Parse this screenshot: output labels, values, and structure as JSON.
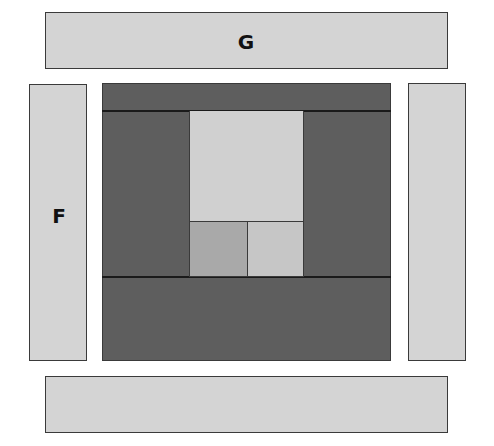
{
  "diagram": {
    "panels": {
      "top": {
        "label": "G"
      },
      "left": {
        "label": "F"
      },
      "right": {
        "label": ""
      },
      "bottom": {
        "label": ""
      }
    },
    "center": {
      "regions": [
        {
          "name": "top-strip"
        },
        {
          "name": "left-column"
        },
        {
          "name": "upper-inner-panel"
        },
        {
          "name": "right-column"
        },
        {
          "name": "small-square-left"
        },
        {
          "name": "small-square-right"
        },
        {
          "name": "bottom-block"
        }
      ]
    },
    "colors": {
      "light_panel": "#d4d4d4",
      "dark_block": "#5e5e5e",
      "inner_light": "#d0d0d0",
      "small_square_left": "#a9a9a9",
      "small_square_right": "#c6c6c6",
      "border": "#3a3a3a"
    }
  }
}
